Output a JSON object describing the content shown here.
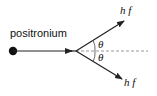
{
  "diagram": {
    "particle_label": "positronium",
    "photon_upper_label": "h f",
    "photon_lower_label": "h f",
    "angle_upper_label": "θ",
    "angle_lower_label": "θ",
    "colors": {
      "line": "#222222",
      "dashed": "#999999",
      "dot": "#111111"
    }
  }
}
